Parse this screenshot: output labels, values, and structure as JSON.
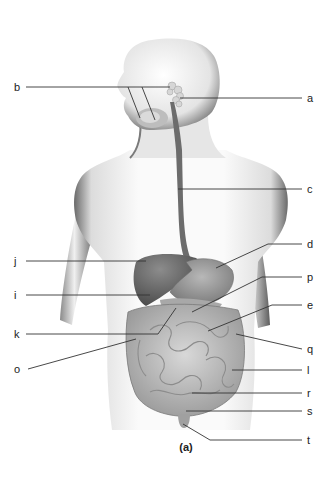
{
  "diagram": {
    "type": "anatomical-labeling",
    "caption": "(a)",
    "colors": {
      "background": "#ffffff",
      "body_light": "#f2f2f2",
      "body_shadow": "#5a5a5a",
      "organ_dark": "#6e6e6e",
      "organ_mid": "#9a9a9a",
      "intestine": "#c4c4c4",
      "leader_line": "#333333"
    },
    "labels": [
      {
        "id": "a",
        "text": "a",
        "side": "right",
        "x": 307,
        "y": 98,
        "line": [
          [
            302,
            98
          ],
          [
            180,
            98
          ]
        ]
      },
      {
        "id": "b",
        "text": "b",
        "side": "left",
        "x": 17,
        "y": 87,
        "line": [
          [
            26,
            87
          ],
          [
            170,
            87
          ]
        ],
        "branches": [
          [
            [
              128,
              87
            ],
            [
              140,
              118
            ]
          ],
          [
            [
              142,
              87
            ],
            [
              155,
              120
            ]
          ]
        ]
      },
      {
        "id": "c",
        "text": "c",
        "side": "right",
        "x": 307,
        "y": 189,
        "line": [
          [
            302,
            189
          ],
          [
            178,
            189
          ]
        ]
      },
      {
        "id": "d",
        "text": "d",
        "side": "right",
        "x": 307,
        "y": 244,
        "line": [
          [
            302,
            244
          ],
          [
            268,
            244
          ],
          [
            216,
            268
          ]
        ]
      },
      {
        "id": "j",
        "text": "j",
        "side": "left",
        "x": 17,
        "y": 261,
        "line": [
          [
            26,
            261
          ],
          [
            146,
            261
          ]
        ]
      },
      {
        "id": "p",
        "text": "p",
        "side": "right",
        "x": 307,
        "y": 277,
        "line": [
          [
            302,
            277
          ],
          [
            262,
            277
          ],
          [
            192,
            312
          ]
        ]
      },
      {
        "id": "i",
        "text": "i",
        "side": "left",
        "x": 17,
        "y": 295,
        "line": [
          [
            26,
            295
          ],
          [
            150,
            295
          ]
        ]
      },
      {
        "id": "e",
        "text": "e",
        "side": "right",
        "x": 307,
        "y": 305,
        "line": [
          [
            302,
            305
          ],
          [
            272,
            305
          ],
          [
            208,
            331
          ]
        ]
      },
      {
        "id": "k",
        "text": "k",
        "side": "left",
        "x": 17,
        "y": 334,
        "line": [
          [
            26,
            334
          ],
          [
            158,
            334
          ],
          [
            176,
            308
          ]
        ]
      },
      {
        "id": "q",
        "text": "q",
        "side": "right",
        "x": 307,
        "y": 349,
        "line": [
          [
            302,
            349
          ],
          [
            236,
            334
          ]
        ]
      },
      {
        "id": "o",
        "text": "o",
        "side": "left",
        "x": 17,
        "y": 369,
        "line": [
          [
            28,
            369
          ],
          [
            136,
            339
          ]
        ]
      },
      {
        "id": "l",
        "text": "l",
        "side": "right",
        "x": 307,
        "y": 370,
        "line": [
          [
            302,
            370
          ],
          [
            232,
            370
          ]
        ]
      },
      {
        "id": "r",
        "text": "r",
        "side": "right",
        "x": 307,
        "y": 393,
        "line": [
          [
            302,
            393
          ],
          [
            192,
            393
          ]
        ]
      },
      {
        "id": "s",
        "text": "s",
        "side": "right",
        "x": 307,
        "y": 411,
        "line": [
          [
            302,
            411
          ],
          [
            186,
            411
          ]
        ]
      },
      {
        "id": "t",
        "text": "t",
        "side": "right",
        "x": 307,
        "y": 440,
        "line": [
          [
            302,
            440
          ],
          [
            210,
            440
          ],
          [
            183,
            424
          ]
        ]
      }
    ]
  }
}
